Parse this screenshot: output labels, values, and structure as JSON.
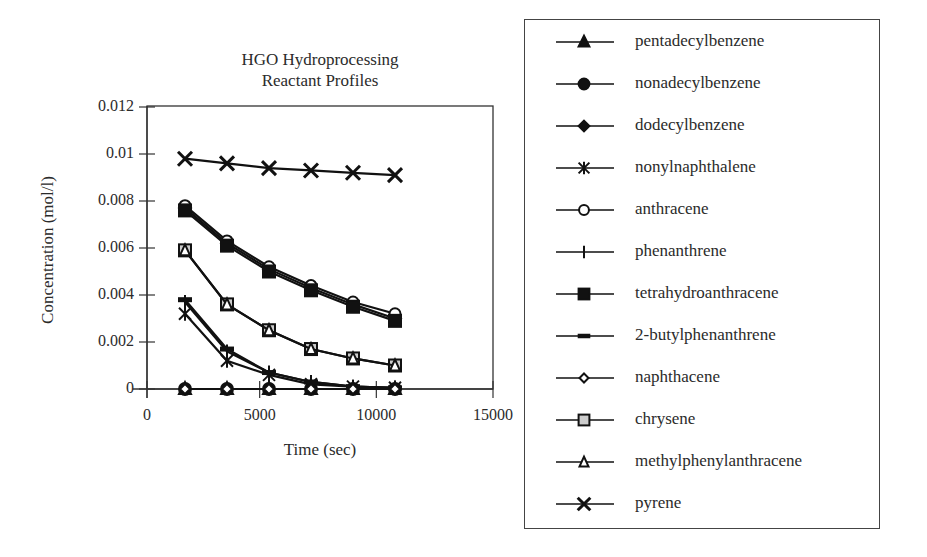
{
  "chart": {
    "title_line1": "HGO Hydroprocessing",
    "title_line2": "Reactant Profiles",
    "xlabel": "Time (sec)",
    "ylabel": "Concentration (mol/l)",
    "x_ticks": [
      "0",
      "5000",
      "10000",
      "15000"
    ],
    "y_ticks": [
      "0",
      "0.002",
      "0.004",
      "0.006",
      "0.008",
      "0.01",
      "0.012"
    ]
  },
  "legend": {
    "items": [
      {
        "label": "pentadecylbenzene",
        "marker": "filled-triangle"
      },
      {
        "label": "nonadecylbenzene",
        "marker": "filled-circle"
      },
      {
        "label": "dodecylbenzene",
        "marker": "filled-diamond"
      },
      {
        "label": "nonylnaphthalene",
        "marker": "asterisk"
      },
      {
        "label": "anthracene",
        "marker": "open-circle"
      },
      {
        "label": "phenanthrene",
        "marker": "plus"
      },
      {
        "label": "tetrahydroanthracene",
        "marker": "filled-square"
      },
      {
        "label": "2-butylphenanthrene",
        "marker": "dash"
      },
      {
        "label": "naphthacene",
        "marker": "open-diamond"
      },
      {
        "label": "chrysene",
        "marker": "gray-square"
      },
      {
        "label": "methylphenylanthracene",
        "marker": "open-triangle"
      },
      {
        "label": "pyrene",
        "marker": "x"
      }
    ]
  },
  "chart_data": {
    "type": "line",
    "title": "HGO Hydroprocessing Reactant Profiles",
    "xlabel": "Time (sec)",
    "ylabel": "Concentration (mol/l)",
    "xlim": [
      0,
      15000
    ],
    "ylim": [
      0,
      0.012
    ],
    "x_ticks": [
      0,
      5000,
      10000,
      15000
    ],
    "y_ticks": [
      0,
      0.002,
      0.004,
      0.006,
      0.008,
      0.01,
      0.012
    ],
    "grid": false,
    "legend_position": "right (outside)",
    "x": [
      1800,
      3600,
      5400,
      7200,
      9000,
      10800
    ],
    "series": [
      {
        "name": "pentadecylbenzene",
        "marker": "filled-triangle",
        "values": [
          0,
          0,
          0,
          0,
          0,
          0
        ]
      },
      {
        "name": "nonadecylbenzene",
        "marker": "filled-circle",
        "values": [
          0,
          0,
          0,
          0,
          0,
          0
        ]
      },
      {
        "name": "dodecylbenzene",
        "marker": "filled-diamond",
        "values": [
          0.0077,
          0.0062,
          0.0051,
          0.0043,
          0.0036,
          0.003
        ]
      },
      {
        "name": "nonylnaphthalene",
        "marker": "asterisk",
        "values": [
          0.0032,
          0.0012,
          0.0006,
          0.0002,
          0.0001,
          5e-05
        ]
      },
      {
        "name": "anthracene",
        "marker": "open-circle",
        "values": [
          0.0078,
          0.0063,
          0.0052,
          0.0044,
          0.0037,
          0.0032
        ]
      },
      {
        "name": "phenanthrene",
        "marker": "plus",
        "values": [
          0.0037,
          0.0016,
          0.0007,
          0.0003,
          0.0001,
          5e-05
        ]
      },
      {
        "name": "tetrahydroanthracene",
        "marker": "filled-square",
        "values": [
          0.0076,
          0.0061,
          0.005,
          0.0042,
          0.0035,
          0.0029
        ]
      },
      {
        "name": "2-butylphenanthrene",
        "marker": "dash",
        "values": [
          0.0038,
          0.0017,
          0.0007,
          0.0003,
          0.0001,
          5e-05
        ]
      },
      {
        "name": "naphthacene",
        "marker": "open-diamond",
        "values": [
          0,
          0,
          0,
          0,
          0,
          0
        ]
      },
      {
        "name": "chrysene",
        "marker": "gray-square",
        "values": [
          0.0059,
          0.0036,
          0.0025,
          0.0017,
          0.0013,
          0.001
        ]
      },
      {
        "name": "methylphenylanthracene",
        "marker": "open-triangle",
        "values": [
          0.0059,
          0.0036,
          0.0025,
          0.0017,
          0.0013,
          0.001
        ]
      },
      {
        "name": "pyrene",
        "marker": "x",
        "values": [
          0.0098,
          0.0096,
          0.0094,
          0.0093,
          0.0092,
          0.0091
        ]
      }
    ]
  }
}
